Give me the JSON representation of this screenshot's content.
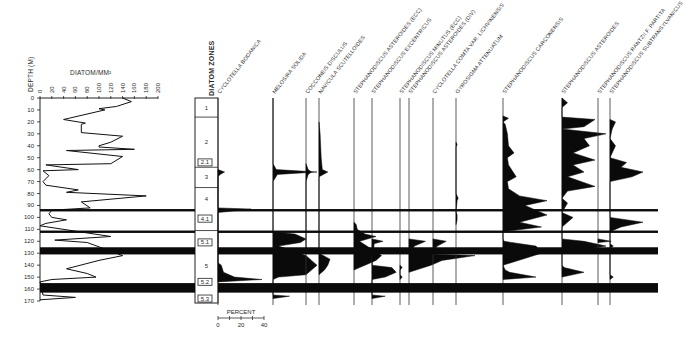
{
  "chart_data": {
    "type": "area",
    "left_panel": {
      "title": "DIATOM/MM²",
      "ylabel": "DEPTH (M)",
      "xlabel": "DIATOM/MM²",
      "x_ticks": [
        0,
        20,
        40,
        60,
        80,
        100,
        120,
        140,
        160,
        180,
        200
      ],
      "y_ticks": [
        0,
        10,
        20,
        30,
        40,
        50,
        60,
        70,
        80,
        90,
        100,
        110,
        120,
        130,
        140,
        150,
        160,
        170
      ],
      "xlim": [
        0,
        200
      ],
      "ylim": [
        0,
        170
      ],
      "grid": false,
      "profile": [
        {
          "depth": 0,
          "value": 140
        },
        {
          "depth": 3,
          "value": 155
        },
        {
          "depth": 7,
          "value": 130
        },
        {
          "depth": 9,
          "value": 100
        },
        {
          "depth": 10,
          "value": 110
        },
        {
          "depth": 18,
          "value": 40
        },
        {
          "depth": 21,
          "value": 77
        },
        {
          "depth": 22,
          "value": 70
        },
        {
          "depth": 29,
          "value": 70
        },
        {
          "depth": 32,
          "value": 140
        },
        {
          "depth": 37,
          "value": 120
        },
        {
          "depth": 40,
          "value": 100
        },
        {
          "depth": 41,
          "value": 100
        },
        {
          "depth": 43,
          "value": 160
        },
        {
          "depth": 44,
          "value": 45
        },
        {
          "depth": 49,
          "value": 140
        },
        {
          "depth": 55,
          "value": 120
        },
        {
          "depth": 56,
          "value": 10
        },
        {
          "depth": 60,
          "value": 65
        },
        {
          "depth": 61,
          "value": 5
        },
        {
          "depth": 65,
          "value": 15
        },
        {
          "depth": 70,
          "value": 5
        },
        {
          "depth": 73,
          "value": 10
        },
        {
          "depth": 77,
          "value": 65
        },
        {
          "depth": 79,
          "value": 45
        },
        {
          "depth": 82,
          "value": 180
        },
        {
          "depth": 87,
          "value": 70
        },
        {
          "depth": 92,
          "value": 85
        },
        {
          "depth": 94,
          "value": 20
        },
        {
          "depth": 97,
          "value": 15
        },
        {
          "depth": 100,
          "value": 20
        },
        {
          "depth": 102,
          "value": 45
        },
        {
          "depth": 105,
          "value": 10
        },
        {
          "depth": 107,
          "value": 0
        },
        {
          "depth": 116,
          "value": 120
        },
        {
          "depth": 119,
          "value": 25
        },
        {
          "depth": 121,
          "value": 80
        },
        {
          "depth": 132,
          "value": 140
        },
        {
          "depth": 136,
          "value": 100
        },
        {
          "depth": 143,
          "value": 45
        },
        {
          "depth": 147,
          "value": 80
        },
        {
          "depth": 150,
          "value": 95
        },
        {
          "depth": 152,
          "value": 20
        },
        {
          "depth": 154,
          "value": 0
        },
        {
          "depth": 165,
          "value": 5
        },
        {
          "depth": 167,
          "value": 60
        },
        {
          "depth": 169,
          "value": 0
        }
      ]
    },
    "zones": {
      "title": "DIATOM ZONES",
      "items": [
        {
          "label": "1",
          "top": 0,
          "bottom": 16
        },
        {
          "label": "2",
          "top": 16,
          "bottom": 58
        },
        {
          "label": "2.1",
          "top": 51,
          "bottom": 55,
          "sub": true
        },
        {
          "label": "3",
          "top": 58,
          "bottom": 75
        },
        {
          "label": "4",
          "top": 75,
          "bottom": 94
        },
        {
          "label": "4.1",
          "top": 98,
          "bottom": 104,
          "sub": true
        },
        {
          "label": "5",
          "top": 111,
          "bottom": 170
        },
        {
          "label": "5.1",
          "top": 118,
          "bottom": 123,
          "sub": true
        },
        {
          "label": "5.2",
          "top": 151,
          "bottom": 156,
          "sub": true
        },
        {
          "label": "5.3",
          "top": 165,
          "bottom": 170,
          "sub": true
        }
      ]
    },
    "percent_scale": {
      "label": "PERCENT",
      "ticks": [
        0,
        20,
        40
      ]
    },
    "bands": [
      {
        "top": 93,
        "bottom": 95
      },
      {
        "top": 111,
        "bottom": 113
      },
      {
        "top": 125,
        "bottom": 131
      },
      {
        "top": 155,
        "bottom": 163
      }
    ],
    "taxa": [
      {
        "name": "CYCLOTELLA BODANICA",
        "max_percent": 40
      },
      {
        "name": "MELOSIRA SOLIDA",
        "max_percent": 40
      },
      {
        "name": "COCCONEIS DISCULUS",
        "max_percent": 5
      },
      {
        "name": "NAVICULA SCUTELLOIDES",
        "max_percent": 10
      },
      {
        "name": "STEPHANODISCUS ASTEROIDES (ECC)",
        "max_percent": 25
      },
      {
        "name": "STEPHANODISCUS EXCENTRICUS",
        "max_percent": 15
      },
      {
        "name": "STEPHANODISCUS MINUTUS (ECC)",
        "max_percent": 5
      },
      {
        "name": "STEPHANODISCUS ASTEROIDES (DIV)",
        "max_percent": 40
      },
      {
        "name": "CYCLOTELLA COMTA VAR. LICHVINENSIS",
        "max_percent": 10
      },
      {
        "name": "GYROSIGMA ATTENUATUM",
        "max_percent": 3
      },
      {
        "name": "STEPHANODISCUS CARCONENSIS",
        "max_percent": 40
      },
      {
        "name": "STEPHANODISCUS ASTEROIDES",
        "max_percent": 45
      },
      {
        "name": "STEPHANODISCUS RANTZII F. PARTITA",
        "max_percent": 5
      },
      {
        "name": "STEPHANODISCUS SUBTRANSYLVANICUS",
        "max_percent": 30
      }
    ]
  },
  "labels": {
    "depth_axis": "DEPTH (M)",
    "conc_title": "DIATOM/MM²",
    "zones_title": "DIATOM ZONES",
    "percent": "PERCENT",
    "pct0": "0",
    "pct20": "20",
    "pct40": "40"
  }
}
